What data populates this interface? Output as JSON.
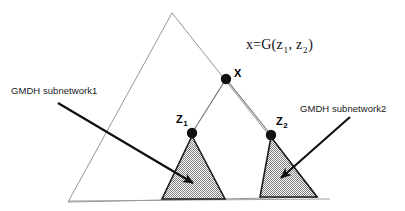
{
  "figure": {
    "name": "gmdh-network-structure-diagram",
    "background_color": "#ffffff"
  },
  "formula": {
    "lead": "x=G(z",
    "sub1": "1",
    "mid": ", z",
    "sub2": "2",
    "close": ")"
  },
  "nodes": [
    {
      "id": "x",
      "label": "X",
      "subscript": "",
      "x": 226,
      "y": 79,
      "radius": 5.2,
      "color": "#111111"
    },
    {
      "id": "z1",
      "label": "Z",
      "subscript": "1",
      "x": 192,
      "y": 133,
      "radius": 5.2,
      "color": "#111111"
    },
    {
      "id": "z2",
      "label": "Z",
      "subscript": "2",
      "x": 271,
      "y": 135,
      "radius": 5.2,
      "color": "#111111"
    }
  ],
  "annotations": [
    {
      "id": "subnetwork1",
      "text": "GMDH subnetwork1",
      "text_x": 11,
      "text_y": 86,
      "arrow_from_x": 58,
      "arrow_from_y": 103,
      "arrow_to_x": 193,
      "arrow_to_y": 183
    },
    {
      "id": "subnetwork2",
      "text": "GMDH subnetwork2",
      "text_x": 300,
      "text_y": 104,
      "arrow_from_x": 350,
      "arrow_from_y": 117,
      "arrow_to_x": 281,
      "arrow_to_y": 178
    }
  ],
  "shapes": {
    "outer_triangle": {
      "name": "outer-network-triangle",
      "points": "172,13 318,197 68,202",
      "stroke": "#8a8a8a",
      "fill": "none"
    },
    "baseline": {
      "name": "baseline",
      "x1": 68,
      "y1": 201,
      "x2": 330,
      "y2": 199,
      "stroke": "#9a9a9a"
    },
    "edges": [
      {
        "name": "edge-x-to-z1",
        "x1": 226,
        "y1": 79,
        "x2": 192,
        "y2": 133,
        "stroke": "#6e6e6e"
      },
      {
        "name": "edge-x-to-z2",
        "x1": 226,
        "y1": 79,
        "x2": 271,
        "y2": 135,
        "stroke": "#6e6e6e"
      }
    ],
    "subnetwork_triangles": [
      {
        "name": "gmdh-subnetwork1-triangle",
        "points": "192,136 225,199 162,199",
        "stroke": "#1c1c1c",
        "fill_color": "#9b9b9b"
      },
      {
        "name": "gmdh-subnetwork2-triangle",
        "points": "271,137 317,197 260,197",
        "stroke": "#1c1c1c",
        "fill_color": "#9b9b9b"
      }
    ]
  }
}
